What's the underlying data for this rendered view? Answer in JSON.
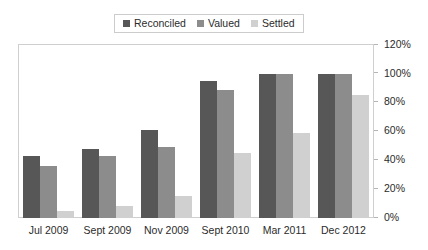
{
  "chart_data": {
    "type": "bar",
    "title": "",
    "subtitle": "",
    "xlabel": "",
    "ylabel": "",
    "grid": false,
    "legend_position": "top",
    "categories": [
      "Jul 2009",
      "Sept 2009",
      "Nov 2009",
      "Sept 2010",
      "Mar 2011",
      "Dec 2012"
    ],
    "ylim": [
      0,
      120
    ],
    "ytick_labels": [
      "0%",
      "20%",
      "40%",
      "60%",
      "80%",
      "100%",
      "120%"
    ],
    "ytick_values": [
      0,
      20,
      40,
      60,
      80,
      100,
      120
    ],
    "series": [
      {
        "name": "Reconciled",
        "color": "#575757",
        "values": [
          43,
          48,
          61,
          95,
          100,
          100
        ]
      },
      {
        "name": "Valued",
        "color": "#8c8c8c",
        "values": [
          36,
          43,
          49,
          89,
          100,
          100
        ]
      },
      {
        "name": "Settled",
        "color": "#d0d0d0",
        "values": [
          5,
          8,
          15,
          45,
          59,
          85
        ]
      }
    ]
  },
  "legend": {
    "items": [
      {
        "label": "Reconciled",
        "color": "#575757"
      },
      {
        "label": "Valued",
        "color": "#8c8c8c"
      },
      {
        "label": "Settled",
        "color": "#d0d0d0"
      }
    ]
  }
}
